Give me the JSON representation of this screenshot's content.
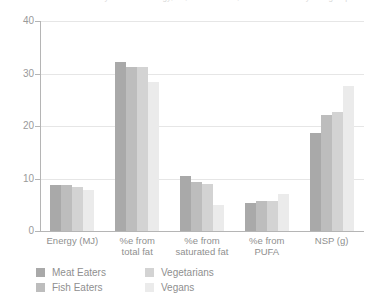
{
  "title": {
    "cropped_text": "Table 3. Mean daily intake of energy, fat, saturated fat, PUFA and NSP by diet group",
    "note": "top line is cut off at the image edge"
  },
  "legend": {
    "position": "bottom-left",
    "items": [
      {
        "label": "Meat Eaters",
        "color": "#a9a9a9"
      },
      {
        "label": "Fish Eaters",
        "color": "#bdbdbd"
      },
      {
        "label": "Vegetarians",
        "color": "#d3d3d3"
      },
      {
        "label": "Vegans",
        "color": "#ebebeb"
      }
    ]
  },
  "axis": {
    "y_ticks": [
      "0",
      "10",
      "20",
      "30",
      "40"
    ],
    "y_tick_values": [
      0,
      10,
      20,
      30,
      40
    ],
    "grid": true
  },
  "chart_data": {
    "type": "bar",
    "title": "",
    "xlabel": "",
    "ylabel": "",
    "ylim": [
      0,
      40
    ],
    "yticks": [
      0,
      10,
      20,
      30,
      40
    ],
    "grid": true,
    "legend_position": "bottom-left",
    "categories": [
      "Energy (MJ)",
      "%e from total fat",
      "%e from saturated fat",
      "%e from PUFA",
      "NSP (g)"
    ],
    "category_lines": [
      [
        "Energy (MJ)"
      ],
      [
        "%e from",
        "total fat"
      ],
      [
        "%e from",
        "saturated fat"
      ],
      [
        "%e from",
        "PUFA"
      ],
      [
        "NSP (g)"
      ]
    ],
    "series": [
      {
        "name": "Meat Eaters",
        "color": "#a9a9a9",
        "values": [
          8.8,
          32.2,
          10.5,
          5.3,
          18.6
        ]
      },
      {
        "name": "Fish Eaters",
        "color": "#bdbdbd",
        "values": [
          8.7,
          31.3,
          9.4,
          5.7,
          22.1
        ]
      },
      {
        "name": "Vegetarians",
        "color": "#d3d3d3",
        "values": [
          8.4,
          31.2,
          9.0,
          5.8,
          22.6
        ]
      },
      {
        "name": "Vegans",
        "color": "#ebebeb",
        "values": [
          7.8,
          28.4,
          5.0,
          7.1,
          27.7
        ]
      }
    ]
  }
}
